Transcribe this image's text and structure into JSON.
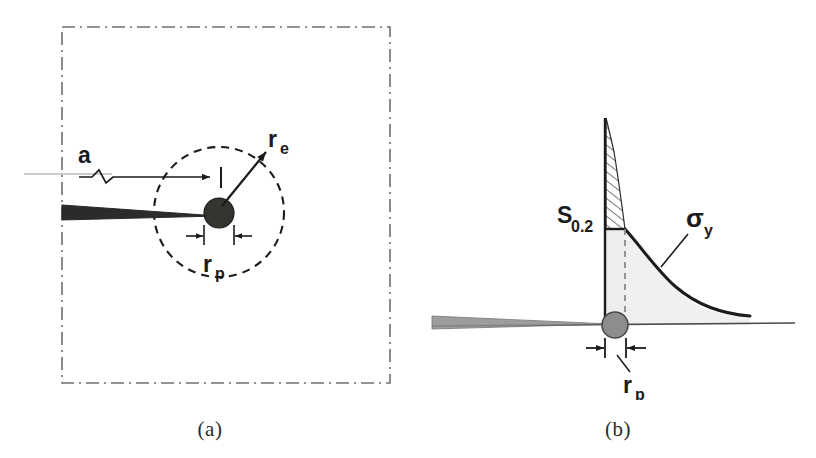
{
  "figure": {
    "background_color": "#ffffff",
    "ink_color": "#1b1b1b",
    "fill_color": "#e8e8e8",
    "blob_color": "#3a3a3a"
  },
  "panel_a": {
    "caption": "(a)",
    "boundary_style": "dash-dot",
    "labels": {
      "crack_length": "a",
      "elastic_radius_main": "r",
      "elastic_radius_sub": "e",
      "plastic_radius_main": "r",
      "plastic_radius_sub": "p"
    },
    "elements": {
      "specimen_boundary": "dash-dot rectangle",
      "plastic_zone_circle": "dashed circle",
      "crack": "horizontal wedge from left boundary to crack tip",
      "crack_tip_blob": "filled dark circle",
      "dimension_a": "arrow with zigzag break",
      "dimension_re": "arrow from crack tip to circle edge",
      "dimension_rp": "inward double arrow across blob"
    }
  },
  "panel_b": {
    "caption": "(b)",
    "labels": {
      "yield_stress_main": "S",
      "yield_stress_sub": "0.2",
      "stress_main": "σ",
      "stress_sub": "y",
      "plastic_radius_main": "r",
      "plastic_radius_sub": "p"
    },
    "elements": {
      "vertical_axis": "stress axis at crack tip",
      "hatched_region": "diagonally hatched area between axis and elastic stress singularity",
      "plateau": "constant yield stress level S 0.2",
      "decay_curve": "elastic-plastic stress distribution decaying with distance",
      "dashed_boundary": "dashed vertical line at plastic zone edge",
      "baseline": "crack plane / ligament line",
      "crack_tip_blob": "filled gray circle at crack tip",
      "dimension_rp": "inward double arrow marking plastic zone size"
    }
  }
}
